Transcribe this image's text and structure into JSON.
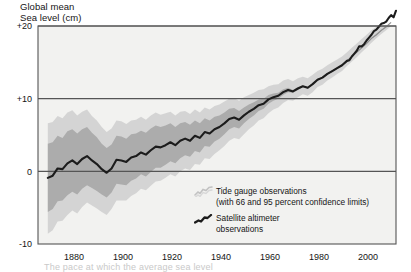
{
  "chart_data": {
    "type": "line",
    "title_line1": "Global mean",
    "title_line2": "Sea level (cm)",
    "xlabel": "",
    "ylabel": "Global mean Sea level (cm)",
    "xlim": [
      1866,
      2012
    ],
    "ylim": [
      -10,
      20
    ],
    "yticks": [
      "+20",
      "+10",
      "0",
      "-10"
    ],
    "ytick_values": [
      20,
      10,
      0,
      -10
    ],
    "xticks": [
      "1880",
      "1900",
      "1920",
      "1940",
      "1960",
      "1980",
      "2000"
    ],
    "xtick_values": [
      1880,
      1900,
      1920,
      1940,
      1960,
      1980,
      2000
    ],
    "grid": true,
    "legend_position": "inside-bottom-right",
    "colors": {
      "satellite_line": "#1c1c1c",
      "tide_line": "#b9b9b9",
      "band_66": "#9a9a9a",
      "band_95": "#c6c6c6",
      "plot_background": "#f2f2f0",
      "axis": "#555555",
      "text": "#151515"
    },
    "series": [
      {
        "name": "Tide gauge observations",
        "note": "(with 66 and 95 percent confidence limits)",
        "x": [
          1870,
          1872,
          1874,
          1876,
          1878,
          1880,
          1882,
          1884,
          1886,
          1888,
          1890,
          1892,
          1894,
          1896,
          1898,
          1900,
          1902,
          1904,
          1906,
          1908,
          1910,
          1912,
          1914,
          1916,
          1918,
          1920,
          1922,
          1924,
          1926,
          1928,
          1930,
          1932,
          1934,
          1936,
          1938,
          1940,
          1942,
          1944,
          1946,
          1948,
          1950,
          1952,
          1954,
          1956,
          1958,
          1960,
          1962,
          1964,
          1966,
          1968,
          1970,
          1972,
          1974,
          1976,
          1978,
          1980,
          1982,
          1984,
          1986,
          1988,
          1990,
          1992,
          1994,
          1996,
          1998,
          2000,
          2002,
          2004,
          2006,
          2008,
          2010
        ],
        "values": [
          -0.9,
          -0.6,
          0.4,
          0.3,
          1.1,
          1.5,
          1.0,
          1.7,
          2.1,
          1.5,
          1.0,
          0.3,
          -0.2,
          0.4,
          1.6,
          1.5,
          1.3,
          1.9,
          2.1,
          2.6,
          2.3,
          2.9,
          3.4,
          3.3,
          3.6,
          4.0,
          3.6,
          4.2,
          4.5,
          4.2,
          4.9,
          4.6,
          5.4,
          5.2,
          5.8,
          6.1,
          6.6,
          7.2,
          7.4,
          7.1,
          7.7,
          8.2,
          8.6,
          9.1,
          9.3,
          9.9,
          10.2,
          10.4,
          10.9,
          11.2,
          11.0,
          11.4,
          11.7,
          11.5,
          12.0,
          12.6,
          12.9,
          13.4,
          13.8,
          14.2,
          14.6,
          15.2,
          15.8,
          16.4,
          17.0,
          17.6,
          18.3,
          18.8,
          19.4,
          19.9,
          20.5
        ],
        "band66_low": [
          -5.6,
          -5.2,
          -4.1,
          -4.0,
          -3.3,
          -2.8,
          -3.2,
          -2.4,
          -1.9,
          -2.3,
          -2.7,
          -3.2,
          -3.6,
          -2.9,
          -1.7,
          -1.8,
          -1.9,
          -1.3,
          -1.0,
          -0.4,
          -0.7,
          -0.1,
          0.5,
          0.5,
          0.9,
          1.4,
          1.1,
          1.8,
          2.2,
          2.0,
          2.8,
          2.6,
          3.5,
          3.4,
          4.1,
          4.5,
          5.1,
          5.8,
          6.1,
          5.9,
          6.6,
          7.2,
          7.7,
          8.3,
          8.6,
          9.3,
          9.7,
          10.0,
          10.5,
          10.9,
          10.8,
          11.2,
          11.6,
          11.4,
          11.9,
          12.5,
          12.8,
          13.3,
          13.7,
          14.1,
          14.5,
          15.1,
          15.7,
          16.3,
          16.9,
          17.5,
          18.2,
          18.7,
          19.3,
          19.8,
          20.4
        ],
        "band66_high": [
          3.8,
          4.0,
          4.9,
          4.6,
          5.5,
          5.8,
          5.2,
          5.8,
          6.1,
          5.3,
          4.7,
          3.8,
          3.2,
          3.7,
          4.9,
          4.8,
          4.5,
          5.1,
          5.2,
          5.6,
          5.3,
          5.9,
          6.3,
          6.1,
          6.3,
          6.6,
          6.1,
          6.6,
          6.8,
          6.4,
          7.0,
          6.6,
          7.3,
          7.0,
          7.5,
          7.7,
          8.1,
          8.6,
          8.7,
          8.3,
          8.8,
          9.2,
          9.5,
          9.9,
          10.0,
          10.5,
          10.7,
          10.8,
          11.3,
          11.5,
          11.2,
          11.6,
          11.8,
          11.6,
          12.1,
          12.7,
          13.0,
          13.5,
          13.9,
          14.3,
          14.7,
          15.3,
          15.9,
          16.5,
          17.1,
          17.7,
          18.4,
          18.9,
          19.5,
          20.0,
          20.6
        ],
        "band95_low": [
          -8.6,
          -8.1,
          -6.9,
          -6.8,
          -6.0,
          -5.4,
          -5.8,
          -4.9,
          -4.3,
          -4.7,
          -5.1,
          -5.6,
          -6.0,
          -5.2,
          -4.0,
          -4.0,
          -4.0,
          -3.4,
          -3.0,
          -2.4,
          -2.6,
          -2.0,
          -1.4,
          -1.3,
          -0.9,
          -0.4,
          -0.7,
          0.0,
          0.4,
          0.2,
          1.0,
          0.9,
          1.8,
          1.7,
          2.4,
          2.9,
          3.5,
          4.2,
          4.6,
          4.4,
          5.1,
          5.8,
          6.3,
          7.0,
          7.3,
          8.0,
          8.5,
          8.8,
          9.4,
          9.8,
          9.7,
          10.2,
          10.6,
          10.4,
          10.9,
          11.6,
          11.9,
          12.5,
          12.9,
          13.4,
          13.8,
          14.5,
          15.1,
          15.7,
          16.4,
          17.0,
          17.7,
          18.3,
          18.9,
          19.4,
          20.0
        ],
        "band95_high": [
          6.6,
          6.8,
          7.6,
          7.3,
          8.1,
          8.4,
          7.7,
          8.2,
          8.5,
          7.6,
          7.0,
          6.1,
          5.4,
          5.9,
          7.0,
          6.9,
          6.5,
          7.0,
          7.1,
          7.5,
          7.1,
          7.7,
          8.1,
          7.8,
          8.0,
          8.2,
          7.7,
          8.2,
          8.3,
          7.9,
          8.5,
          8.1,
          8.8,
          8.5,
          9.0,
          9.2,
          9.6,
          10.0,
          10.1,
          9.7,
          10.2,
          10.5,
          10.8,
          11.2,
          11.3,
          11.7,
          11.9,
          12.0,
          12.5,
          12.7,
          12.4,
          12.8,
          13.0,
          12.8,
          13.3,
          13.8,
          14.1,
          14.6,
          15.0,
          15.4,
          15.8,
          16.4,
          17.0,
          17.6,
          18.2,
          18.8,
          19.4,
          19.9,
          20.5,
          21.0,
          21.6
        ]
      },
      {
        "name": "Satellite altimeter observations",
        "x": [
          1993,
          1994,
          1995,
          1996,
          1997,
          1998,
          1999,
          2000,
          2001,
          2002,
          2003,
          2004,
          2005,
          2006,
          2007,
          2008,
          2009,
          2010,
          2011,
          2012
        ],
        "values": [
          15.3,
          15.8,
          16.2,
          16.6,
          17.2,
          17.2,
          17.5,
          18.0,
          18.4,
          18.8,
          19.3,
          19.5,
          19.9,
          20.3,
          20.4,
          20.6,
          21.1,
          21.5,
          21.2,
          22.1
        ]
      }
    ]
  },
  "legend": {
    "items": [
      {
        "label": "Tide gauge observations",
        "sublabel": "(with 66 and 95 percent confidence limits)",
        "marker": "tide-gauge-squiggle-icon"
      },
      {
        "label": "Satellite altimeter",
        "sublabel": "observations",
        "marker": "satellite-squiggle-icon"
      }
    ]
  },
  "caption": "The pace at which the average sea level"
}
